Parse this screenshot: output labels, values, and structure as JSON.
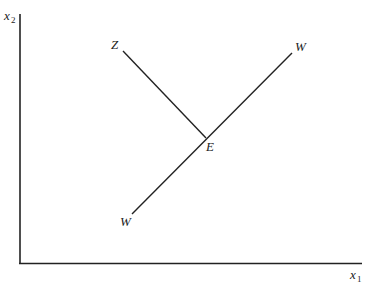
{
  "diagram": {
    "type": "economics-graph",
    "axes": {
      "y_label": {
        "base": "x",
        "subscript": "2"
      },
      "x_label": {
        "base": "x",
        "subscript": "1"
      }
    },
    "lines": [
      {
        "name": "ZE",
        "from_label": "Z",
        "to_label": "E"
      },
      {
        "name": "WW",
        "from_label": "W",
        "to_label": "W"
      }
    ],
    "points": {
      "Z": "Z",
      "W_top": "W",
      "W_bottom": "W",
      "E": "E"
    }
  }
}
